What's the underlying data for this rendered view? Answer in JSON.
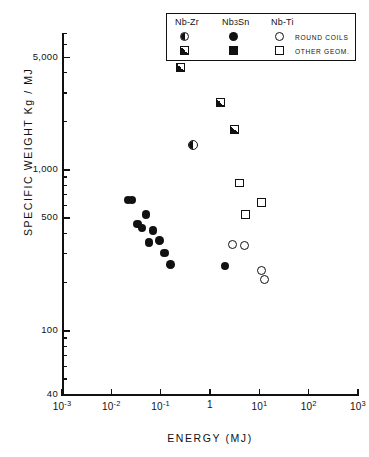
{
  "chart_data": {
    "type": "scatter",
    "title": "",
    "xlabel": "ENERGY  (MJ)",
    "ylabel": "SPECIFIC  WEIGHT    Kg / MJ",
    "xscale": "log",
    "yscale": "log",
    "xlim": [
      0.001,
      1000
    ],
    "ylim": [
      40,
      7000
    ],
    "xticklabels": [
      "10-3",
      "10-2",
      "10-1",
      "1",
      "101",
      "102",
      "103"
    ],
    "xtickvalues": [
      0.001,
      0.01,
      0.1,
      1,
      10,
      100,
      1000
    ],
    "yticklabels": [
      "5,000",
      "1,000",
      "500",
      "100",
      "40"
    ],
    "ytickvalues": [
      5000,
      1000,
      500,
      100,
      40
    ],
    "grid": false,
    "legend_position": "top-right",
    "series": [
      {
        "name": "Nb-Zr round coils",
        "marker": "circle-half",
        "points": [
          [
            0.45,
            1400
          ]
        ]
      },
      {
        "name": "Nb-Zr other geom.",
        "marker": "square-half",
        "points": [
          [
            0.25,
            4300
          ],
          [
            1.6,
            2600
          ],
          [
            3.2,
            1750
          ]
        ]
      },
      {
        "name": "Nb3Sn round coils",
        "marker": "circle-filled",
        "points": [
          [
            0.022,
            640
          ],
          [
            0.026,
            640
          ],
          [
            0.05,
            520
          ],
          [
            0.034,
            455
          ],
          [
            0.042,
            430
          ],
          [
            0.07,
            415
          ],
          [
            0.058,
            350
          ],
          [
            0.095,
            360
          ],
          [
            0.12,
            300
          ],
          [
            0.16,
            255
          ],
          [
            2.0,
            250
          ]
        ]
      },
      {
        "name": "Nb-Ti round coils",
        "marker": "circle-open",
        "points": [
          [
            2.8,
            340
          ],
          [
            5.0,
            335
          ],
          [
            11.0,
            235
          ],
          [
            13.0,
            205
          ]
        ]
      },
      {
        "name": "Nb-Ti other geom.",
        "marker": "square-open",
        "points": [
          [
            4.0,
            820
          ],
          [
            11.0,
            620
          ],
          [
            5.2,
            520
          ]
        ]
      }
    ]
  },
  "legend": {
    "headers": [
      {
        "label": "Nb-Zr",
        "sub": ""
      },
      {
        "label": "Nb",
        "sub": "3",
        "tail": "Sn"
      },
      {
        "label": "Nb-Ti",
        "sub": ""
      }
    ],
    "header_nbzr": "Nb-Zr",
    "header_nb3sn_pre": "Nb",
    "header_nb3sn_sub": "3",
    "header_nb3sn_post": "Sn",
    "header_nbti": "Nb-Ti",
    "row1_text": "ROUND COILS",
    "row2_text": "OTHER GEOM."
  },
  "axes": {
    "x_title": "ENERGY  (MJ)",
    "y_title": "SPECIFIC  WEIGHT    Kg / MJ",
    "x_labels": [
      {
        "base": "10",
        "exp": "-3"
      },
      {
        "base": "10",
        "exp": "-2"
      },
      {
        "base": "10",
        "exp": "-1"
      },
      {
        "base": "1",
        "exp": ""
      },
      {
        "base": "10",
        "exp": "1"
      },
      {
        "base": "10",
        "exp": "2"
      },
      {
        "base": "10",
        "exp": "3"
      }
    ],
    "y_labels": [
      "5,000",
      "1,000",
      "500",
      "100",
      "40"
    ]
  },
  "colors": {
    "ink": "#111111",
    "paper": "#ffffff"
  }
}
